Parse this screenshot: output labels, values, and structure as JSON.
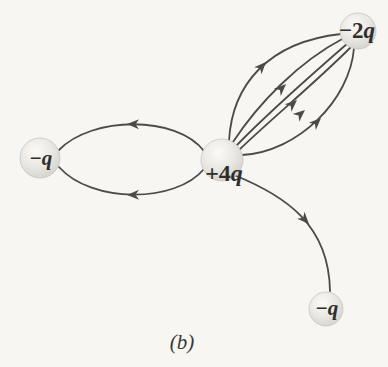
{
  "figure": {
    "caption": "(b)",
    "colors": {
      "background": "#f7f6f2",
      "field_line": "#4c4b49",
      "label_text": "#2f2e2c",
      "ball_highlight": "#fbfaf7",
      "ball_mid": "#e9e8e4",
      "ball_edge": "#d3d2cc"
    }
  },
  "charges": [
    {
      "position": "center",
      "label": "+4q",
      "coefficient": "+4",
      "symbol": "q"
    },
    {
      "position": "top-right",
      "label": "−2q",
      "coefficient": "−2",
      "symbol": "q"
    },
    {
      "position": "left",
      "label": "−q",
      "coefficient": "−",
      "symbol": "q"
    },
    {
      "position": "bottom-right",
      "label": "−q",
      "coefficient": "−",
      "symbol": "q"
    }
  ],
  "field_line_groups": [
    {
      "from": "+4q",
      "to": "−2q (top-right)",
      "line_count": 5,
      "arrows": "point toward −2q"
    },
    {
      "from": "+4q",
      "to": "−q (left)",
      "line_count": 2,
      "arrows": "point toward −q"
    },
    {
      "from": "+4q",
      "to": "−q (bottom-right)",
      "line_count": 1,
      "arrows": "point toward −q"
    }
  ]
}
